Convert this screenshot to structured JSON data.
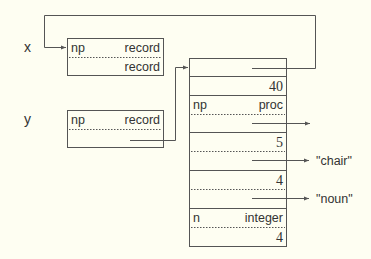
{
  "diagram": {
    "variables": [
      {
        "name": "x",
        "cells": [
          {
            "left": "np",
            "right": "record"
          },
          {
            "left": "",
            "right": "record"
          }
        ]
      },
      {
        "name": "y",
        "cells": [
          {
            "left": "np",
            "right": "record"
          },
          {
            "left": "",
            "right": ""
          }
        ]
      }
    ],
    "memory": {
      "rows": [
        {
          "label_left": "",
          "label_right": "",
          "value": ""
        },
        {
          "value": "40"
        },
        {
          "label_left": "np",
          "label_right": "proc",
          "value": ""
        },
        {
          "value": "5",
          "pointer_target": "\"chair\""
        },
        {
          "value": "4",
          "pointer_target": "\"noun\""
        },
        {
          "label_left": "n",
          "label_right": "integer",
          "value": "4"
        }
      ]
    },
    "strings": [
      "\"chair\"",
      "\"noun\""
    ],
    "colors": {
      "background": "#fefef2",
      "stroke": "#555555",
      "text": "#333333"
    }
  }
}
